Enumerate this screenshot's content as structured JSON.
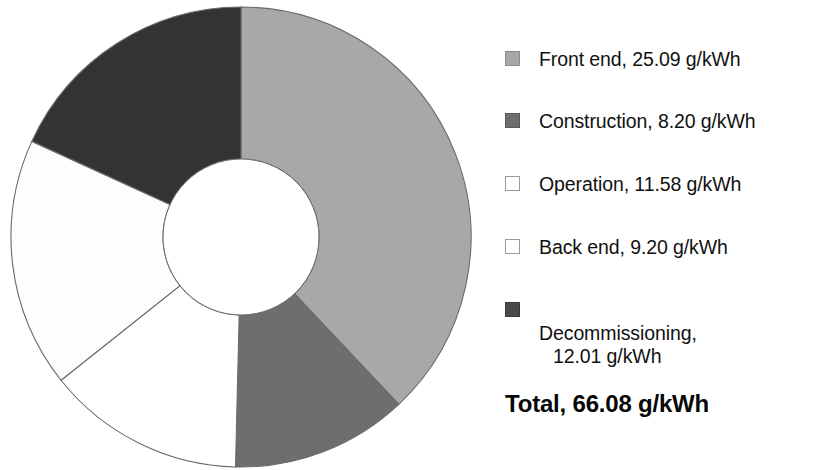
{
  "chart_data": {
    "type": "pie",
    "variant": "donut",
    "title": "",
    "subtitle": "",
    "xlabel": "",
    "ylabel": "",
    "unit": "g/kWh",
    "categories": [
      "Front end",
      "Construction",
      "Operation",
      "Back end",
      "Decommissioning"
    ],
    "values": [
      25.09,
      8.2,
      11.58,
      9.2,
      12.01
    ],
    "value_labels": [
      "25.09 g/kWh",
      "8.20 g/kWh",
      "11.58 g/kWh",
      "9.20 g/kWh",
      "12.01 g/kWh"
    ],
    "slice_colors": [
      "#a8a8a8",
      "#6e6e6e",
      "#fdfdfd",
      "#ffffff",
      "#333333"
    ],
    "slice_order_clockwise_from_top": [
      "Front end",
      "Construction",
      "Back end",
      "Operation",
      "Decommissioning"
    ],
    "total": 66.08,
    "total_label": "Total, 66.08 g/kWh",
    "legend_position": "right",
    "grid": false,
    "slice_outline_color": "#6a6a6a",
    "inner_hole_color": "#ffffff"
  },
  "legend": {
    "items": [
      {
        "name": "Front end",
        "value": "25.09",
        "unit": "g/kWh",
        "text": "Front end, 25.09 g/kWh",
        "swatch_color": "#a8a8a8",
        "swatch_border": "#8c8c8c"
      },
      {
        "name": "Construction",
        "value": "8.20",
        "unit": "g/kWh",
        "text": "Construction, 8.20 g/kWh",
        "swatch_color": "#6e6e6e",
        "swatch_border": "#5a5a5a"
      },
      {
        "name": "Operation",
        "value": "11.58",
        "unit": "g/kWh",
        "text": "Operation, 11.58 g/kWh",
        "swatch_color": "#ffffff",
        "swatch_border": "#9a9a9a"
      },
      {
        "name": "Back end",
        "value": "9.20",
        "unit": "g/kWh",
        "text": "Back end, 9.20 g/kWh",
        "swatch_color": "#ffffff",
        "swatch_border": "#9a9a9a"
      },
      {
        "name": "Decommissioning",
        "value": "12.01",
        "unit": "g/kWh",
        "text": "Decommissioning,",
        "text_line2": "12.01 g/kWh",
        "swatch_color": "#4a4a4a",
        "swatch_border": "#3a3a3a"
      }
    ]
  },
  "total": {
    "text": "Total, 66.08 g/kWh",
    "value": "66.08",
    "unit": "g/kWh"
  }
}
